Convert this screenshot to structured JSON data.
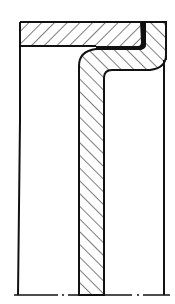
{
  "drawing": {
    "type": "cross-section",
    "description": "Sectional view of a sleeve/housing with L-shaped insert and seal lip",
    "colors": {
      "line": "#111111",
      "background": "#ffffff"
    },
    "parts": [
      {
        "name": "top-flange-band",
        "hatch": "forward-diagonal"
      },
      {
        "name": "l-shaped-sleeve",
        "hatch": "backward-diagonal"
      },
      {
        "name": "seal-layer",
        "fill": "solid"
      }
    ]
  }
}
